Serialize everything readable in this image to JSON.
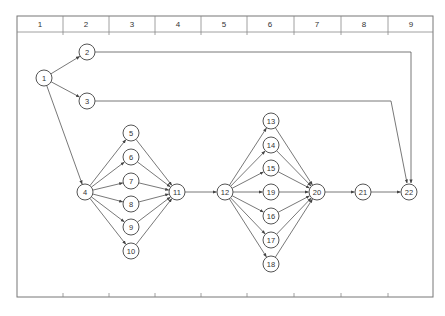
{
  "header": {
    "columns": [
      "1",
      "2",
      "3",
      "4",
      "5",
      "6",
      "7",
      "8",
      "9"
    ]
  },
  "colors": {
    "line": "#555555",
    "frame": "#777777",
    "text": "#333333",
    "background": "#ffffff"
  },
  "network": {
    "nodes": [
      {
        "id": "1",
        "x": 44,
        "y": 78
      },
      {
        "id": "2",
        "x": 87,
        "y": 52
      },
      {
        "id": "3",
        "x": 87,
        "y": 101
      },
      {
        "id": "4",
        "x": 85,
        "y": 192
      },
      {
        "id": "5",
        "x": 131,
        "y": 133
      },
      {
        "id": "6",
        "x": 131,
        "y": 157
      },
      {
        "id": "7",
        "x": 131,
        "y": 181
      },
      {
        "id": "8",
        "x": 131,
        "y": 204
      },
      {
        "id": "9",
        "x": 131,
        "y": 227
      },
      {
        "id": "10",
        "x": 131,
        "y": 251
      },
      {
        "id": "11",
        "x": 177,
        "y": 192
      },
      {
        "id": "12",
        "x": 225,
        "y": 192
      },
      {
        "id": "13",
        "x": 271,
        "y": 121
      },
      {
        "id": "14",
        "x": 271,
        "y": 145
      },
      {
        "id": "15",
        "x": 271,
        "y": 168
      },
      {
        "id": "19",
        "x": 271,
        "y": 192
      },
      {
        "id": "16",
        "x": 271,
        "y": 216
      },
      {
        "id": "17",
        "x": 271,
        "y": 240
      },
      {
        "id": "18",
        "x": 271,
        "y": 264
      },
      {
        "id": "20",
        "x": 317,
        "y": 192
      },
      {
        "id": "21",
        "x": 363,
        "y": 192
      },
      {
        "id": "22",
        "x": 409,
        "y": 192
      }
    ],
    "edges": [
      {
        "from": "1",
        "to": "2"
      },
      {
        "from": "1",
        "to": "3"
      },
      {
        "from": "1",
        "to": "4"
      },
      {
        "from": "2",
        "to": "22",
        "route": [
          [
            411,
            52
          ],
          [
            411,
            183
          ]
        ]
      },
      {
        "from": "3",
        "to": "22",
        "route": [
          [
            391,
            101
          ],
          [
            407,
            183
          ]
        ]
      },
      {
        "from": "4",
        "to": "5"
      },
      {
        "from": "4",
        "to": "6"
      },
      {
        "from": "4",
        "to": "7"
      },
      {
        "from": "4",
        "to": "8"
      },
      {
        "from": "4",
        "to": "9"
      },
      {
        "from": "4",
        "to": "10"
      },
      {
        "from": "5",
        "to": "11"
      },
      {
        "from": "6",
        "to": "11"
      },
      {
        "from": "7",
        "to": "11"
      },
      {
        "from": "8",
        "to": "11"
      },
      {
        "from": "9",
        "to": "11"
      },
      {
        "from": "10",
        "to": "11"
      },
      {
        "from": "11",
        "to": "12"
      },
      {
        "from": "12",
        "to": "13"
      },
      {
        "from": "12",
        "to": "14"
      },
      {
        "from": "12",
        "to": "15"
      },
      {
        "from": "12",
        "to": "19"
      },
      {
        "from": "12",
        "to": "16"
      },
      {
        "from": "12",
        "to": "17"
      },
      {
        "from": "12",
        "to": "18"
      },
      {
        "from": "13",
        "to": "20"
      },
      {
        "from": "14",
        "to": "20"
      },
      {
        "from": "15",
        "to": "20"
      },
      {
        "from": "19",
        "to": "20"
      },
      {
        "from": "16",
        "to": "20"
      },
      {
        "from": "17",
        "to": "20"
      },
      {
        "from": "18",
        "to": "20"
      },
      {
        "from": "20",
        "to": "21"
      },
      {
        "from": "21",
        "to": "22"
      }
    ]
  }
}
